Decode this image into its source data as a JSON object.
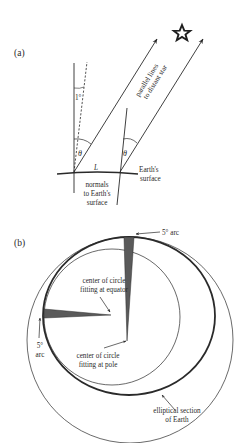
{
  "panel_a": {
    "label": "(a)",
    "angle_small": "1°",
    "theta_left": "θ",
    "theta_right": "θ",
    "distance_label": "L",
    "rays_label_line1": "parallel lines",
    "rays_label_line2": "to distant star",
    "surface_label_line1": "Earth's",
    "surface_label_line2": "surface",
    "normals_label_line1": "normals",
    "normals_label_line2": "to Earth's",
    "normals_label_line3": "surface",
    "star_icon": "star-outline"
  },
  "panel_b": {
    "label": "(b)",
    "top_arc_label": "5° arc",
    "left_arc_label_line1": "5°",
    "left_arc_label_line2": "arc",
    "equator_center_line1": "center of circle",
    "equator_center_line2": "fitting at equator",
    "pole_center_line1": "center of circle",
    "pole_center_line2": "fitting at pole",
    "ellipse_label_line1": "elliptical section",
    "ellipse_label_line2": "of Earth"
  },
  "colors": {
    "ink": "#2a2a2a",
    "wedge_fill": "#5a5a5a"
  }
}
